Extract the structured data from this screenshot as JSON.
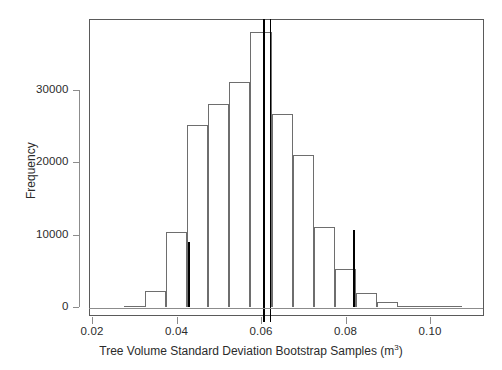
{
  "chart_data": {
    "type": "bar",
    "title": "",
    "subtitle": "",
    "xlabel": "Tree Volume Standard Deviation Bootstrap Samples (m3)",
    "xlabel_main": "Tree Volume Standard Deviation Bootstrap Samples (m",
    "xlabel_sup": "3",
    "xlabel_tail": ")",
    "ylabel": "Frequency",
    "xlim": [
      0.0155,
      0.1095
    ],
    "ylim": [
      0,
      40500
    ],
    "grid": false,
    "legend": null,
    "bin_width": 0.005,
    "x_ticks": [
      0.02,
      0.04,
      0.06,
      0.08,
      0.1
    ],
    "x_tick_labels": [
      "0.02",
      "0.04",
      "0.06",
      "0.08",
      "0.10"
    ],
    "y_ticks": [
      0,
      10000,
      20000,
      30000
    ],
    "y_tick_labels": [
      "0",
      "10000",
      "20000",
      "30000"
    ],
    "bin_starts": [
      0.0275,
      0.0325,
      0.0375,
      0.0425,
      0.0475,
      0.0525,
      0.0575,
      0.0625,
      0.0675,
      0.0725,
      0.0775,
      0.0825,
      0.0875,
      0.0925,
      0.0975,
      0.1025
    ],
    "values": [
      200,
      2200,
      10300,
      25100,
      28100,
      31100,
      38000,
      26700,
      21000,
      11000,
      5200,
      1900,
      700,
      200,
      100,
      0
    ],
    "annotations": [
      {
        "name": "observed-statistic-line",
        "x": 0.0605,
        "style": "solid",
        "full_height": true
      },
      {
        "name": "bootstrap-mean-line",
        "x": 0.0622,
        "style": "dotted",
        "full_height": true
      },
      {
        "name": "ci-lower-line",
        "x": 0.0427,
        "style": "solid",
        "value": 9000
      },
      {
        "name": "ci-upper-line",
        "x": 0.0817,
        "style": "solid",
        "value": 10600
      }
    ]
  },
  "colors": {
    "bar_outline": "#6e6e6e",
    "frame": "#5a5a5a",
    "axis": "#8c8c8c",
    "text": "#2b2b2b",
    "annotation": "#000000",
    "background": "#ffffff"
  }
}
